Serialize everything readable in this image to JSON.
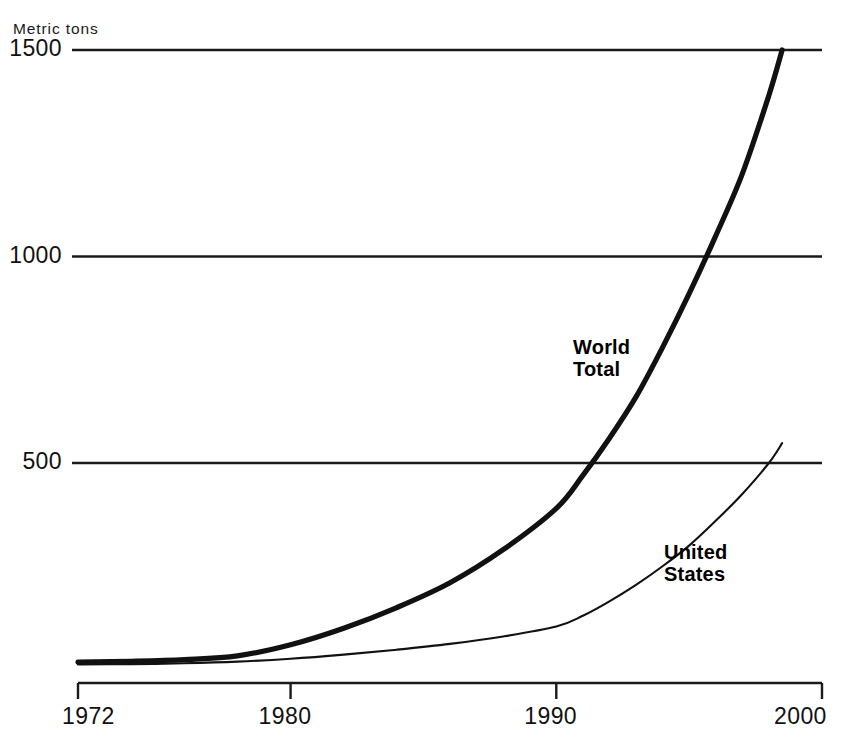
{
  "chart_data": {
    "type": "line",
    "title": "",
    "subtitle": "",
    "xlabel": "",
    "ylabel": "Metric tons",
    "unit_label": "Metric tons",
    "xlim": [
      1972,
      2000
    ],
    "ylim": [
      0,
      1530
    ],
    "grid": "horizontal-only",
    "legend_position": "inline-annotations",
    "y_ticks": [
      {
        "value": 1500,
        "label": "1500"
      },
      {
        "value": 1000,
        "label": "1000"
      },
      {
        "value": 500,
        "label": "500"
      }
    ],
    "x_ticks": [
      {
        "value": 1972,
        "label": "1972"
      },
      {
        "value": 1980,
        "label": "1980"
      },
      {
        "value": 1990,
        "label": "1990"
      },
      {
        "value": 2000,
        "label": "2000"
      }
    ],
    "series": [
      {
        "name": "World Total",
        "label_line1": "World",
        "label_line2": "Total",
        "color": "#111111",
        "width": 5.2,
        "x": [
          1972,
          1974,
          1976,
          1978,
          1980,
          1982,
          1984,
          1986,
          1988,
          1990,
          1991,
          1992,
          1993,
          1994,
          1995,
          1996,
          1997,
          1998,
          1998.5
        ],
        "values": [
          18,
          20,
          24,
          33,
          60,
          100,
          150,
          210,
          290,
          390,
          470,
          560,
          660,
          780,
          910,
          1050,
          1200,
          1390,
          1500
        ]
      },
      {
        "name": "United States",
        "label_line1": "United",
        "label_line2": "States",
        "color": "#111111",
        "width": 2.1,
        "x": [
          1972,
          1974,
          1976,
          1978,
          1980,
          1982,
          1984,
          1986,
          1988,
          1990,
          1991,
          1992,
          1993,
          1994,
          1995,
          1996,
          1997,
          1998,
          1998.5
        ],
        "values": [
          12,
          13,
          15,
          19,
          26,
          36,
          48,
          62,
          80,
          104,
          130,
          165,
          205,
          250,
          300,
          360,
          425,
          500,
          548
        ]
      }
    ]
  },
  "geometry": {
    "plot_left": 72,
    "plot_right": 822,
    "x_origin": 78,
    "y_1500": 50,
    "y_1000": 263,
    "y_500": 463,
    "y_zero": 657,
    "axis_line_y": 683,
    "tick_len": 16
  }
}
